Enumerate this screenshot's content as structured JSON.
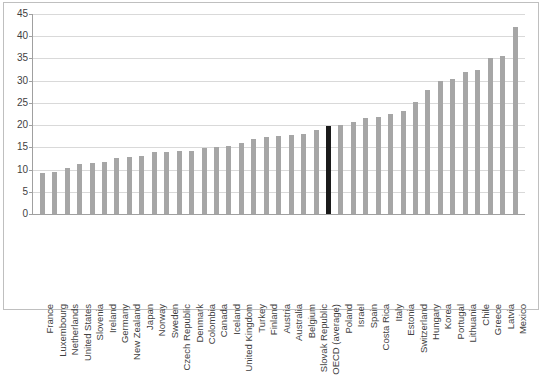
{
  "chart_data": {
    "type": "bar",
    "title": "",
    "subtitle": "",
    "xlabel": "",
    "ylabel": "",
    "ylim": [
      0,
      45
    ],
    "ytick_values": [
      0,
      5,
      10,
      15,
      20,
      25,
      30,
      35,
      40,
      45
    ],
    "ytick_labels": [
      "0",
      "5",
      "10",
      "15",
      "20",
      "25",
      "30",
      "35",
      "40",
      "45"
    ],
    "grid": "horizontal",
    "legend": "none",
    "bar_color": "#a6a6a6",
    "highlight_color": "#1a1a1a",
    "highlight_category": "OECD (average)",
    "categories": [
      "France",
      "Luxembourg",
      "Netherlands",
      "United States",
      "Slovenia",
      "Ireland",
      "Germany",
      "New Zealand",
      "Japan",
      "Norway",
      "Sweden",
      "Czech Republic",
      "Denmark",
      "Colombia",
      "Canada",
      "Iceland",
      "United Kingdom",
      "Turkey",
      "Finland",
      "Austria",
      "Australia",
      "Belgium",
      "Slovak Republic",
      "OECD (average)",
      "Poland",
      "Israel",
      "Spain",
      "Costa Rica",
      "Italy",
      "Estonia",
      "Switzerland",
      "Hungary",
      "Korea",
      "Portugal",
      "Lithuania",
      "Chile",
      "Greece",
      "Latvia",
      "Mexico"
    ],
    "values": [
      9.2,
      9.4,
      10.4,
      11.2,
      11.5,
      11.6,
      12.6,
      12.9,
      13.0,
      13.9,
      13.9,
      14.1,
      14.2,
      14.9,
      15.0,
      15.4,
      15.9,
      16.8,
      17.3,
      17.6,
      17.8,
      18.1,
      19.0,
      19.7,
      20.0,
      20.8,
      21.5,
      21.8,
      22.5,
      23.2,
      25.2,
      28.0,
      30.0,
      30.3,
      32.0,
      32.5,
      35.0,
      35.5,
      42.0
    ]
  }
}
